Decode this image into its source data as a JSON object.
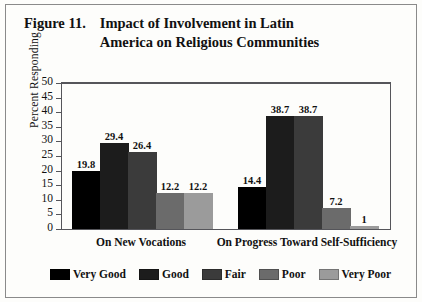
{
  "figure": {
    "number": "Figure 11.",
    "title_line1": "Impact of Involvement in Latin",
    "title_line2": "America on Religious Communities"
  },
  "chart_data": {
    "type": "bar",
    "title": "Impact of Involvement in Latin America on Religious Communities",
    "xlabel": "",
    "ylabel": "Percent Responding",
    "ylim": [
      0,
      50
    ],
    "ytick_step": 5,
    "yticks": [
      0,
      5,
      10,
      15,
      20,
      25,
      30,
      35,
      40,
      45,
      50
    ],
    "grid": false,
    "legend_position": "bottom",
    "categories": [
      "On New Vocations",
      "On Progress Toward Self-Sufficiency"
    ],
    "series": [
      {
        "name": "Very Good",
        "color": "#000000",
        "values": [
          19.8,
          14.4
        ],
        "labels": [
          "19.8",
          "14.4"
        ]
      },
      {
        "name": "Good",
        "color": "#1c1c1c",
        "values": [
          29.4,
          38.7
        ],
        "labels": [
          "29.4",
          "38.7"
        ]
      },
      {
        "name": "Fair",
        "color": "#3b3b3b",
        "values": [
          26.4,
          38.7
        ],
        "labels": [
          "26.4",
          "38.7"
        ]
      },
      {
        "name": "Poor",
        "color": "#6b6b6b",
        "values": [
          12.2,
          7.2
        ],
        "labels": [
          "12.2",
          "7.2"
        ]
      },
      {
        "name": "Very Poor",
        "color": "#9b9b9b",
        "values": [
          12.2,
          1.0
        ],
        "labels": [
          "12.2",
          "1"
        ]
      }
    ]
  }
}
